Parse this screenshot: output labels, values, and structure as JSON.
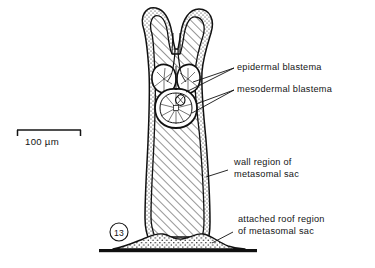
{
  "figure": {
    "number": "13",
    "background_color": "#ffffff",
    "ink_color": "#111111"
  },
  "scale_bar": {
    "label": "100 µm",
    "length_px": 64,
    "value": 100,
    "unit": "µm"
  },
  "labels": {
    "epidermal_blastema": "epidermal  blastema",
    "mesodermal_blastema": "mesodermal  blastema",
    "wall_region_line1": "wall region of",
    "wall_region_line2": "metasomal  sac",
    "attached_roof_line1": "attached roof region",
    "attached_roof_line2": "of  metasomal  sac"
  },
  "structures": {
    "wall_fill": "diagonal-hatching",
    "margin_fill": "stipple",
    "roof_fill": "stipple",
    "baseline": "solid-black-bar"
  }
}
